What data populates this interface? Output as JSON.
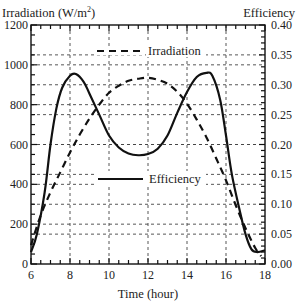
{
  "chart_data": {
    "type": "line",
    "title": "",
    "xlabel": "Time (hour)",
    "ylabel_left": "Irradiation (W/m²)",
    "ylabel_left_base": "Irradiation (W/m",
    "ylabel_left_sup": "2",
    "ylabel_left_close": ")",
    "ylabel_right": "Efficiency",
    "xlim": [
      6,
      18
    ],
    "ylim_left": [
      0,
      1200
    ],
    "ylim_right": [
      0.0,
      0.4
    ],
    "x_ticks": [
      "6",
      "8",
      "10",
      "12",
      "14",
      "16",
      "18"
    ],
    "y_left_ticks": [
      "0",
      "200",
      "400",
      "600",
      "800",
      "1000",
      "1200"
    ],
    "y_right_ticks": [
      "0.00",
      "0.05",
      "0.10",
      "0.15",
      "0.20",
      "0.25",
      "0.30",
      "0.35",
      "0.40"
    ],
    "grid": true,
    "legend_position": "inside, upper center (Irradiation) and middle (Efficiency)",
    "series": [
      {
        "name": "Irradiation",
        "axis": "left",
        "style": "dashed",
        "color": "#111111",
        "x": [
          6.0,
          6.5,
          7.0,
          7.5,
          8.0,
          8.5,
          9.0,
          9.5,
          10.0,
          10.5,
          11.0,
          11.5,
          12.0,
          12.5,
          13.0,
          13.5,
          14.0,
          14.5,
          15.0,
          15.5,
          16.0,
          16.5,
          17.0,
          17.5,
          17.8
        ],
        "values": [
          95,
          245,
          360,
          460,
          560,
          650,
          730,
          800,
          860,
          895,
          920,
          930,
          935,
          925,
          905,
          865,
          805,
          725,
          635,
          530,
          420,
          295,
          180,
          80,
          40
        ]
      },
      {
        "name": "Efficiency",
        "axis": "right",
        "style": "solid",
        "color": "#111111",
        "x": [
          6.0,
          6.3,
          6.7,
          7.0,
          7.3,
          7.6,
          8.0,
          8.3,
          8.7,
          9.0,
          9.5,
          10.0,
          10.5,
          11.0,
          11.5,
          12.0,
          12.5,
          13.0,
          13.5,
          14.0,
          14.5,
          15.0,
          15.3,
          15.7,
          16.0,
          16.3,
          16.7,
          17.0,
          17.3,
          17.6,
          18.0
        ],
        "values": [
          0.02,
          0.05,
          0.12,
          0.2,
          0.26,
          0.295,
          0.315,
          0.318,
          0.305,
          0.285,
          0.25,
          0.215,
          0.195,
          0.185,
          0.182,
          0.184,
          0.193,
          0.215,
          0.253,
          0.288,
          0.313,
          0.32,
          0.315,
          0.275,
          0.215,
          0.15,
          0.09,
          0.05,
          0.025,
          0.02,
          0.023
        ]
      }
    ]
  },
  "legend": {
    "irradiation_label": "Irradiation",
    "efficiency_label": "Efficiency"
  }
}
